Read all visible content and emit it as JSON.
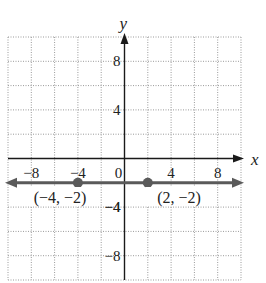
{
  "chart_data": {
    "type": "line",
    "title": "",
    "xlabel": "x",
    "ylabel": "y",
    "xlim": [
      -10,
      10
    ],
    "ylim": [
      -10,
      10
    ],
    "grid": true,
    "grid_step": 2,
    "x_ticks": [
      -8,
      -4,
      0,
      4,
      8
    ],
    "y_ticks": [
      8,
      4,
      -4,
      -8
    ],
    "x_tick_labels": [
      "−8",
      "−4",
      "0",
      "4",
      "8"
    ],
    "y_tick_labels": [
      "8",
      "4",
      "−4",
      "−8"
    ],
    "series": [
      {
        "name": "y = −2",
        "kind": "horizontal line with arrows",
        "y": -2,
        "color": "#5a5a5a"
      }
    ],
    "points": [
      {
        "x": -4,
        "y": -2,
        "label": "(−4, −2)"
      },
      {
        "x": 2,
        "y": -2,
        "label": "(2, −2)"
      }
    ],
    "colors": {
      "axis": "#1a1a1a",
      "grid": "#9a9a9a",
      "line": "#5a5a5a",
      "point": "#5a5a5a"
    }
  }
}
